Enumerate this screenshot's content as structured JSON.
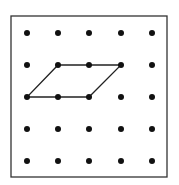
{
  "diagram": {
    "type": "geoboard",
    "grid": {
      "rows": 5,
      "cols": 5
    },
    "frame": {
      "x": 11,
      "y": 16,
      "width": 156,
      "height": 161,
      "stroke": "#333333"
    },
    "dot_x": [
      27,
      58,
      89,
      121,
      152
    ],
    "dot_y": [
      33,
      65,
      97,
      129,
      161
    ],
    "dot_color": "#111111",
    "dot_radius": 3,
    "shape": {
      "name": "parallelogram",
      "vertices_grid": [
        [
          1,
          1
        ],
        [
          3,
          1
        ],
        [
          2,
          2
        ],
        [
          0,
          2
        ]
      ],
      "stroke": "#222222"
    }
  }
}
